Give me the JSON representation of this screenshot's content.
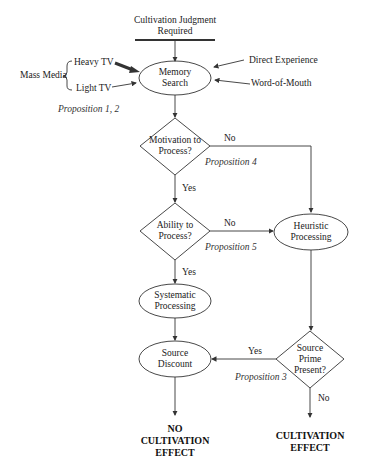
{
  "diagram": {
    "start": {
      "label_line1": "Cultivation Judgment",
      "label_line2": "Required"
    },
    "inputs": {
      "group_label": "Mass Media",
      "heavy_tv": "Heavy TV",
      "light_tv": "Light TV",
      "direct_experience": "Direct Experience",
      "word_of_mouth": "Word-of-Mouth"
    },
    "nodes": {
      "memory_search": {
        "line1": "Memory",
        "line2": "Search"
      },
      "motivation": {
        "line1": "Motivation to",
        "line2": "Process?"
      },
      "ability": {
        "line1": "Ability to",
        "line2": "Process?"
      },
      "heuristic": {
        "line1": "Heuristic",
        "line2": "Processing"
      },
      "systematic": {
        "line1": "Systematic",
        "line2": "Processing"
      },
      "source_discount": {
        "line1": "Source",
        "line2": "Discount"
      },
      "source_prime": {
        "line1": "Source",
        "line2": "Prime",
        "line3": "Present?"
      }
    },
    "edges": {
      "motivation_no": "No",
      "motivation_yes": "Yes",
      "ability_no": "No",
      "ability_yes": "Yes",
      "prime_yes": "Yes",
      "prime_no": "No"
    },
    "propositions": {
      "p12": "Proposition 1, 2",
      "p4": "Proposition 4",
      "p5": "Proposition 5",
      "p3": "Proposition 3"
    },
    "outcomes": {
      "no_effect_line1": "NO",
      "no_effect_line2": "CULTIVATION",
      "no_effect_line3": "EFFECT",
      "effect_line1": "CULTIVATION",
      "effect_line2": "EFFECT"
    },
    "colors": {
      "stroke": "#333333",
      "text": "#222222",
      "background": "#ffffff"
    }
  }
}
